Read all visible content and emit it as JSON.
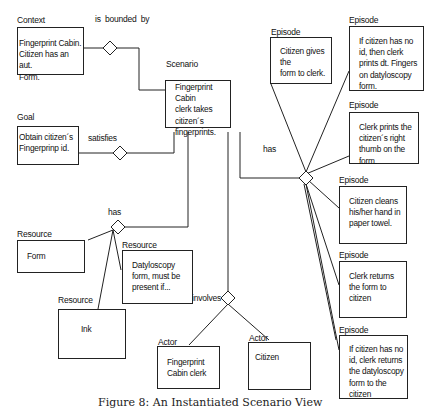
{
  "diagram": {
    "caption": "Figure 8: An Instantiated Scenario View",
    "relations": {
      "bounded": "is bounded by",
      "satisfies": "satisfies",
      "has_episodes": "has",
      "has_resources": "has",
      "involves": "involves"
    },
    "context": {
      "type": "Context",
      "text": "Fingerprint Cabin.\nCitizen has an aut.\nForm."
    },
    "goal": {
      "type": "Goal",
      "text": "Obtain citizen´s\nFingerprinp id."
    },
    "scenario": {
      "type": "Scenario",
      "text": "Fingerprint Cabin\nclerk takes\ncitizen´s\nfingerprints."
    },
    "episodes": [
      {
        "type": "Episode",
        "text": "Citizen gives the\nform  to clerk."
      },
      {
        "type": "Episode",
        "text": "If citizen has no\n id, then clerk\nprints dt. Fingers\non datyloscopy\nform."
      },
      {
        "type": "Episode",
        "text": "Clerk prints the\ncitizen´s right\nthumb on the\nform."
      },
      {
        "type": "Episode",
        "text": "Citizen cleans\nhis/her hand in\npaper towel."
      },
      {
        "type": "Episode",
        "text": "Clerk returns\nthe form to\ncitizen"
      },
      {
        "type": "Episode",
        "text": "If citizen has no\nid, clerk returns\nthe datyloscopy\nform to the\ncitizen"
      }
    ],
    "resources": [
      {
        "type": "Resource",
        "text": "Form"
      },
      {
        "type": "Resource",
        "text": "Datyloscopy\nform, must be\npresent if..."
      },
      {
        "type": "Resource",
        "text": "Ink"
      }
    ],
    "actors": [
      {
        "type": "Actor",
        "text": "Fingerprint\nCabin clerk"
      },
      {
        "type": "Actor",
        "text": "Citizen"
      }
    ]
  }
}
